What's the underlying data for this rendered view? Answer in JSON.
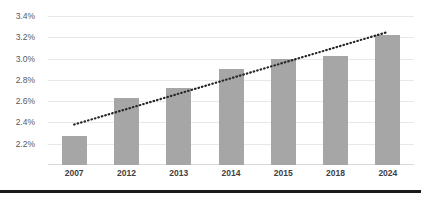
{
  "chart_data": {
    "type": "bar",
    "title": "",
    "subtitle": "",
    "xlabel": "",
    "ylabel": "",
    "categories": [
      "2007",
      "2012",
      "2013",
      "2014",
      "2015",
      "2018",
      "2024"
    ],
    "values": [
      2.27,
      2.63,
      2.72,
      2.9,
      3.0,
      3.02,
      3.22
    ],
    "value_suffix": "%",
    "ylim": [
      2.0,
      3.4
    ],
    "ytick_values": [
      3.4,
      3.2,
      3.0,
      2.8,
      2.6,
      2.4,
      2.2
    ],
    "ytick_labels": [
      "3.4%",
      "3.2%",
      "3.0%",
      "2.8%",
      "2.6%",
      "2.4%",
      "2.2%"
    ],
    "grid": true,
    "legend": "none",
    "series": [
      {
        "name": "value",
        "type": "bar",
        "color": "#a6a6a6",
        "values": [
          2.27,
          2.63,
          2.72,
          2.9,
          3.0,
          3.02,
          3.22
        ]
      },
      {
        "name": "trendline",
        "type": "line",
        "style": "dotted",
        "color": "#262626",
        "start": {
          "x_index": 0,
          "value": 2.38
        },
        "end": {
          "x_index": 6,
          "value": 3.25
        }
      }
    ]
  },
  "colors": {
    "bar": "#a6a6a6",
    "gridline": "#e8e8e8",
    "axis_text": "#595959",
    "category_text": "#404040",
    "trendline": "#262626",
    "footer_rule": "#1a1a1a",
    "background": "#ffffff"
  }
}
